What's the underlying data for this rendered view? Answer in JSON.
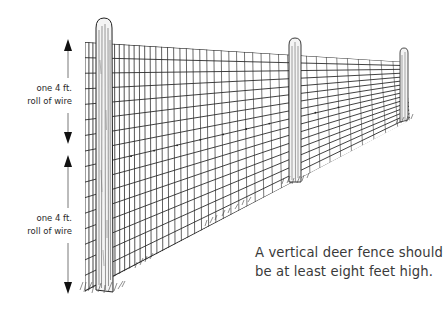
{
  "diagram": {
    "type": "illustration",
    "dimension_labels": [
      {
        "line1": "one 4 ft.",
        "line2": "roll of wire",
        "position": "upper"
      },
      {
        "line1": "one 4 ft.",
        "line2": "roll of wire",
        "position": "lower"
      }
    ],
    "caption": {
      "line1": "A vertical deer fence should",
      "line2": "be at least eight feet high."
    },
    "posts": 3,
    "colors": {
      "ink": "#1a1a1a",
      "wire": "#2b2b2b",
      "text": "#3a3a3a",
      "background": "#ffffff"
    }
  }
}
